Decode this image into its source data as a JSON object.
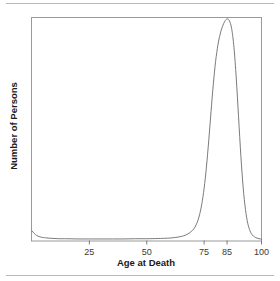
{
  "figure": {
    "background_color": "#ffffff",
    "has_top_rule": true,
    "has_bottom_rule": true,
    "rule_color": "#b9b9b9"
  },
  "chart_data": {
    "type": "line",
    "title": "",
    "subtitle": "",
    "xlabel": "Age at Death",
    "ylabel": "Number of Persons",
    "xlim": [
      0,
      100
    ],
    "ylim": [
      0,
      1.0
    ],
    "grid": false,
    "legend": null,
    "legend_position": "none",
    "x_tick_labels": [
      "25",
      "50",
      "75",
      "85",
      "100"
    ],
    "x_tick_values": [
      25,
      50,
      75,
      85,
      100
    ],
    "y_tick_labels": [],
    "y_tick_values": [],
    "axis_line_color": "#9a9a9a",
    "curve_color": "#6b6b6b",
    "annotations": [],
    "series": [
      {
        "name": "Number of Persons",
        "x": [
          0,
          1,
          2,
          3,
          4,
          5,
          6,
          8,
          10,
          12,
          15,
          20,
          25,
          30,
          35,
          40,
          45,
          50,
          55,
          58,
          60,
          62,
          64,
          66,
          68,
          70,
          71,
          72,
          73,
          74,
          75,
          76,
          77,
          78,
          79,
          80,
          81,
          82,
          83,
          84,
          85,
          86,
          87,
          88,
          89,
          90,
          91,
          92,
          93,
          94,
          95,
          96,
          97,
          98,
          99,
          100
        ],
        "values": [
          0.043,
          0.031,
          0.023,
          0.018,
          0.015,
          0.013,
          0.012,
          0.01,
          0.009,
          0.008,
          0.008,
          0.007,
          0.007,
          0.007,
          0.007,
          0.007,
          0.008,
          0.008,
          0.009,
          0.01,
          0.011,
          0.013,
          0.016,
          0.021,
          0.03,
          0.046,
          0.06,
          0.082,
          0.115,
          0.165,
          0.235,
          0.33,
          0.448,
          0.578,
          0.702,
          0.805,
          0.878,
          0.928,
          0.962,
          0.985,
          0.996,
          0.988,
          0.952,
          0.868,
          0.73,
          0.556,
          0.382,
          0.24,
          0.14,
          0.078,
          0.043,
          0.025,
          0.016,
          0.011,
          0.008,
          0.006
        ]
      }
    ]
  }
}
